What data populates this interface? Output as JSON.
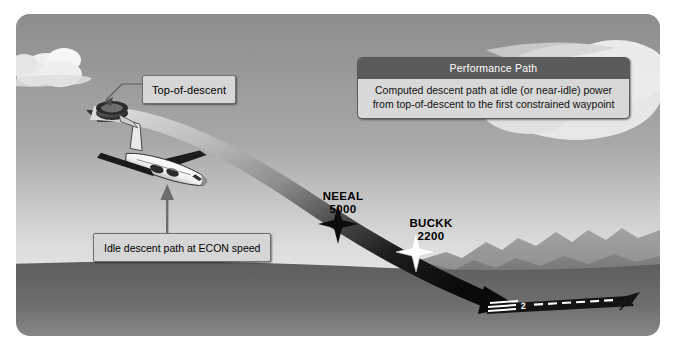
{
  "diagram": {
    "colors": {
      "sky_top": "#8f8f8f",
      "sky_bottom": "#efefef",
      "ground": "#636363",
      "mountain_far": "#9d9d9d",
      "mountain_near": "#7b7b7b",
      "path_light": "#d2d2d2",
      "path_dark": "#101010",
      "callout_bg": "#d6d6d6",
      "callout_border": "#6e6e6e",
      "header_bg": "#5b5b5b",
      "header_text": "#ffffff",
      "cloud": "#f2f2f2",
      "runway": "#151515",
      "frame_border": "#ffffff"
    }
  },
  "callouts": {
    "top_of_descent": {
      "label": "Top-of-descent"
    },
    "idle_descent": {
      "label": "Idle descent path at ECON speed"
    },
    "performance_path": {
      "header": "Performance Path",
      "line1": "Computed descent path at idle (or near-idle) power",
      "line2": "from top-of-descent to the first constrained waypoint"
    }
  },
  "waypoints": [
    {
      "name": "NEEAL",
      "altitude": "5000",
      "marker": "star-dark"
    },
    {
      "name": "BUCKK",
      "altitude": "2200",
      "marker": "star-white"
    }
  ],
  "runway": {
    "number": "2"
  }
}
